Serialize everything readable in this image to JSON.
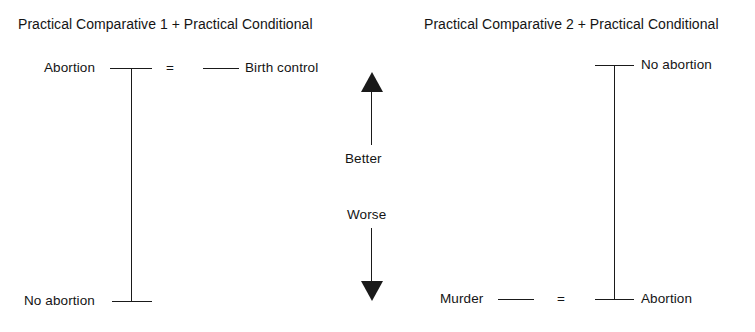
{
  "figure": {
    "background_color": "#ffffff",
    "ink_color": "#1a1a1a"
  },
  "left_panel": {
    "title": "Practical Comparative 1 + Practical Conditional",
    "top": {
      "left_label": "Abortion",
      "relation": "=",
      "right_label": "Birth control"
    },
    "bottom": {
      "left_label": "No abortion"
    }
  },
  "center_axis": {
    "up_label": "Better",
    "down_label": "Worse",
    "up_arrow_icon": "arrow-up-icon",
    "down_arrow_icon": "arrow-down-icon"
  },
  "right_panel": {
    "title": "Practical Comparative 2 + Practical Conditional",
    "top": {
      "right_label": "No abortion"
    },
    "bottom": {
      "left_label": "Murder",
      "relation": "=",
      "right_label": "Abortion"
    }
  }
}
